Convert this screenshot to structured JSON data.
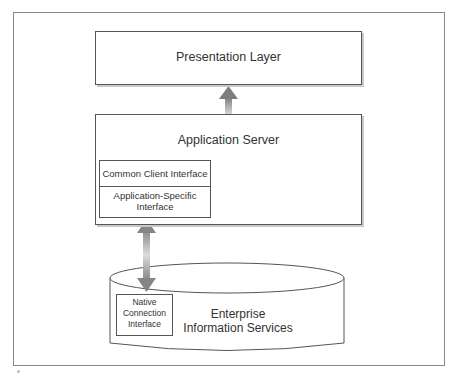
{
  "diagram": {
    "presentation_layer": {
      "label": "Presentation Layer"
    },
    "application_server": {
      "label": "Application Server",
      "common_client_interface": "Common Client Interface",
      "application_specific_interface_line1": "Application-Specific",
      "application_specific_interface_line2": "Interface"
    },
    "eis": {
      "label_line1": "Enterprise",
      "label_line2": "Information Services",
      "native_line1": "Native",
      "native_line2": "Connection",
      "native_line3": "Interface"
    },
    "arrows": [
      {
        "from": "application_server",
        "to": "presentation_layer",
        "direction": "up"
      },
      {
        "from": "application_specific_interface",
        "to": "native_connection_interface",
        "direction": "bidirectional"
      }
    ],
    "colors": {
      "stroke": "#555555",
      "arrow": "#8a8a8a",
      "shadow": "#c8c8c8",
      "frame": "#888888"
    }
  }
}
